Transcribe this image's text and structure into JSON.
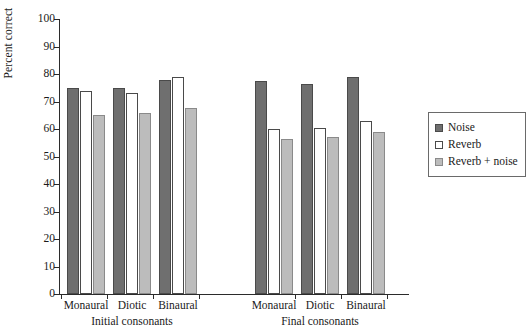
{
  "chart_data": {
    "type": "bar",
    "title": "",
    "xlabel": "",
    "ylabel": "Percent correct",
    "ylim": [
      0,
      100
    ],
    "ytick_step": 10,
    "yticks": [
      100,
      90,
      80,
      70,
      60,
      50,
      40,
      30,
      20,
      10,
      0
    ],
    "grid": false,
    "legend_position": "right",
    "group_labels": [
      "Initial consonants",
      "Final consonants"
    ],
    "categories": [
      "Monaural",
      "Diotic",
      "Binaural",
      "Monaural",
      "Diotic",
      "Binaural"
    ],
    "series": [
      {
        "name": "Noise",
        "color": "#6f6f6f",
        "values": [
          75,
          75,
          78,
          77.5,
          76.5,
          79
        ]
      },
      {
        "name": "Reverb",
        "color": "#ffffff",
        "values": [
          74,
          73,
          79,
          60,
          60.5,
          63
        ]
      },
      {
        "name": "Reverb + noise",
        "color": "#bcbcbc",
        "values": [
          65,
          66,
          67.5,
          56.5,
          57,
          59
        ]
      }
    ]
  },
  "legend": {
    "items": [
      {
        "label": "Noise",
        "swatch": "noise"
      },
      {
        "label": "Reverb",
        "swatch": "reverb"
      },
      {
        "label": "Reverb + noise",
        "swatch": "reverbnoise"
      }
    ]
  }
}
